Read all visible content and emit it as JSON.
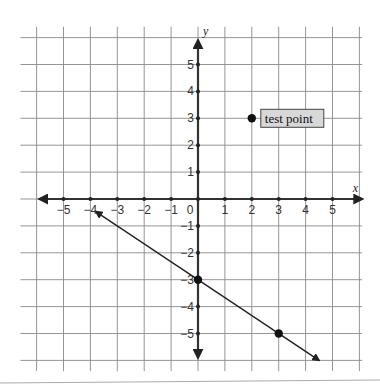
{
  "chart_data": {
    "type": "scatter",
    "title": "",
    "xlabel": "x",
    "ylabel": "y",
    "xlim": [
      -6,
      6
    ],
    "ylim": [
      -6,
      6
    ],
    "grid": true,
    "x_ticks": [
      -5,
      -4,
      -3,
      -2,
      -1,
      0,
      1,
      2,
      3,
      4,
      5
    ],
    "y_ticks": [
      -5,
      -4,
      -3,
      -2,
      -1,
      1,
      2,
      3,
      4,
      5
    ],
    "x_tick_labels": [
      "−5",
      "−4",
      "−3",
      "−2",
      "−1",
      "0",
      "1",
      "2",
      "3",
      "4",
      "5"
    ],
    "y_tick_labels": [
      "−5",
      "−4",
      "−3",
      "−2",
      "−1",
      "1",
      "2",
      "3",
      "4",
      "5"
    ],
    "line": {
      "description": "line through (0,-3) and (3,-5), arrows both ends",
      "slope": -0.6667,
      "intercept": -3,
      "x_start": -3.8,
      "x_end": 4.5
    },
    "points": [
      {
        "x": 0,
        "y": -3,
        "label": ""
      },
      {
        "x": 3,
        "y": -5,
        "label": ""
      },
      {
        "x": 2,
        "y": 3,
        "label": "test point"
      }
    ]
  }
}
